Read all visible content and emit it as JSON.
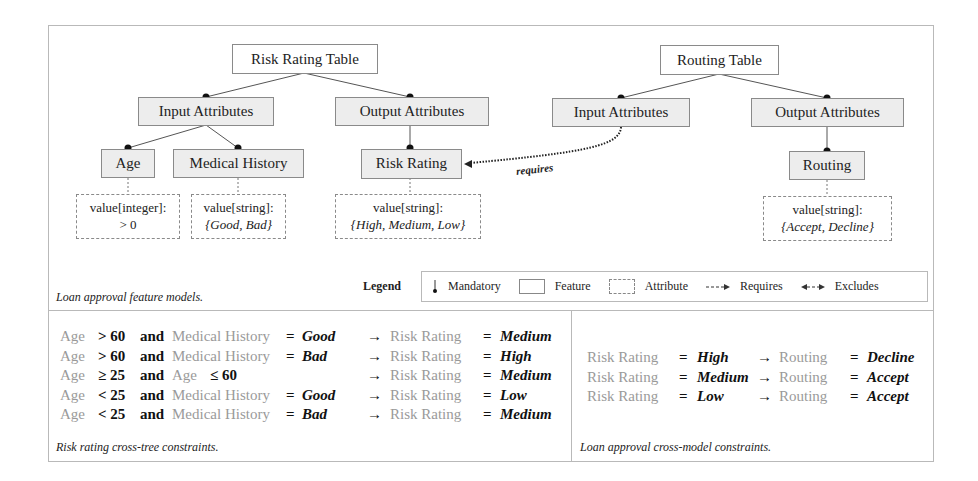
{
  "left_model": {
    "root": "Risk Rating Table",
    "input_group": "Input Attributes",
    "output_group": "Output Attributes",
    "features": [
      {
        "label": "Age",
        "attr_line1": "value[integer]:",
        "attr_line2": "> 0"
      },
      {
        "label": "Medical History",
        "attr_line1": "value[string]:",
        "attr_line2": "{Good, Bad}"
      },
      {
        "label": "Risk Rating",
        "attr_line1": "value[string]:",
        "attr_line2": "{High, Medium, Low}"
      }
    ]
  },
  "right_model": {
    "root": "Routing Table",
    "input_group": "Input Attributes",
    "output_group": "Output Attributes",
    "features": [
      {
        "label": "Routing",
        "attr_line1": "value[string]:",
        "attr_line2": "{Accept, Decline}"
      }
    ]
  },
  "requires_label": "requires",
  "feature_model_caption": "Loan approval feature models.",
  "legend": {
    "title": "Legend",
    "items": [
      {
        "symbol": "mandatory-icon",
        "label": "Mandatory"
      },
      {
        "symbol": "feature-box",
        "label": "Feature"
      },
      {
        "symbol": "attribute-box",
        "label": "Attribute"
      },
      {
        "symbol": "requires-arrow",
        "label": "Requires"
      },
      {
        "symbol": "excludes-arrow",
        "label": "Excludes"
      }
    ]
  },
  "cross_tree": {
    "caption": "Risk rating cross-tree constraints.",
    "rules": [
      {
        "a": "Age",
        "op1": "> 60",
        "and": "and",
        "b": "Medical History",
        "op2": "=",
        "bval": "Good",
        "arrow": "→",
        "target": "Risk Rating",
        "eq": "=",
        "result": "Medium"
      },
      {
        "a": "Age",
        "op1": "> 60",
        "and": "and",
        "b": "Medical History",
        "op2": "=",
        "bval": "Bad",
        "arrow": "→",
        "target": "Risk Rating",
        "eq": "=",
        "result": "High"
      },
      {
        "a": "Age",
        "op1": "≥ 25",
        "and": "and",
        "b": "Age",
        "op2": "≤ 60",
        "bval": "",
        "arrow": "→",
        "target": "Risk Rating",
        "eq": "=",
        "result": "Medium"
      },
      {
        "a": "Age",
        "op1": "< 25",
        "and": "and",
        "b": "Medical History",
        "op2": "=",
        "bval": "Good",
        "arrow": "→",
        "target": "Risk Rating",
        "eq": "=",
        "result": "Low"
      },
      {
        "a": "Age",
        "op1": "< 25",
        "and": "and",
        "b": "Medical History",
        "op2": "=",
        "bval": "Bad",
        "arrow": "→",
        "target": "Risk Rating",
        "eq": "=",
        "result": "Medium"
      }
    ]
  },
  "cross_model": {
    "caption": "Loan approval cross-model constraints.",
    "rules": [
      {
        "a": "Risk Rating",
        "eq1": "=",
        "aval": "High",
        "arrow": "→",
        "target": "Routing",
        "eq2": "=",
        "result": "Decline"
      },
      {
        "a": "Risk Rating",
        "eq1": "=",
        "aval": "Medium",
        "arrow": "→",
        "target": "Routing",
        "eq2": "=",
        "result": "Accept"
      },
      {
        "a": "Risk Rating",
        "eq1": "=",
        "aval": "Low",
        "arrow": "→",
        "target": "Routing",
        "eq2": "=",
        "result": "Accept"
      }
    ]
  }
}
